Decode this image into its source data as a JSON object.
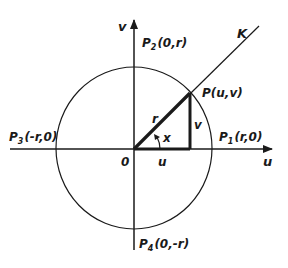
{
  "figure": {
    "type": "unit-circle-coordinate-diagram",
    "colors": {
      "ink": "#1a1a1a",
      "background": "#ffffff"
    },
    "axes": {
      "horizontal_label": "u",
      "vertical_label": "v",
      "origin_label": "0"
    },
    "ray_label": "K",
    "points": [
      {
        "id": "P",
        "name": "P",
        "subscript": "",
        "coords": "(u,v)"
      },
      {
        "id": "P1",
        "name": "P",
        "subscript": "1",
        "coords": "(r,0)"
      },
      {
        "id": "P2",
        "name": "P",
        "subscript": "2",
        "coords": "(0,r)"
      },
      {
        "id": "P3",
        "name": "P",
        "subscript": "3",
        "coords": "(-r,0)"
      },
      {
        "id": "P4",
        "name": "P",
        "subscript": "4",
        "coords": "(0,-r)"
      }
    ],
    "segment_labels": {
      "radius": "r",
      "angle": "x",
      "horizontal_leg": "u",
      "vertical_leg": "v"
    }
  }
}
